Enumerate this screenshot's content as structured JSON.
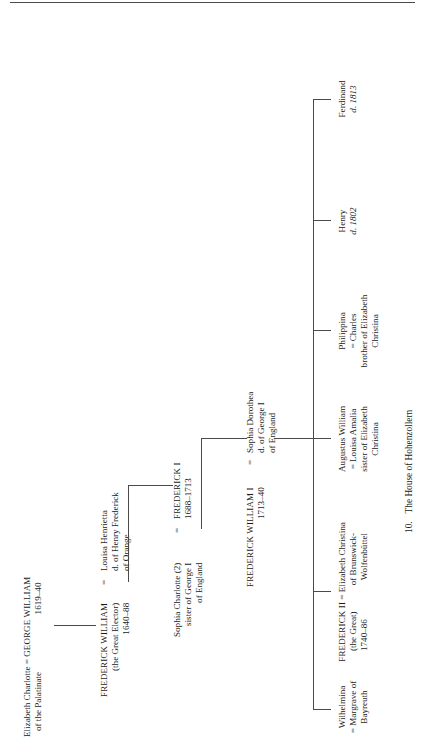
{
  "page": {
    "caption_number": "10.",
    "caption_title": "The House of Hohenzollern"
  },
  "generations": [
    {
      "id": "gen1",
      "nodes": [
        {
          "id": "n-george-william",
          "role": "couple",
          "lines": [
            "Elizabeth Charlotte = GEORGE WILLIAM",
            "of the Palatinate                    1619–40"
          ],
          "spouse_left": "Elizabeth Charlotte",
          "spouse_left_detail": "of the Palatinate",
          "principal": "GEORGE WILLIAM",
          "principal_dates": "1619–40"
        }
      ]
    },
    {
      "id": "gen2",
      "nodes": [
        {
          "id": "n-frederick-william-elector",
          "role": "couple",
          "principal": "FREDERICK WILLIAM",
          "principal_detail": "(the Great Elector)",
          "principal_dates": "1640–88",
          "equals": "=",
          "spouse_right": "Louisa Henrietta",
          "spouse_right_detail_1": "d. of Henry Frederick",
          "spouse_right_detail_2": "of Orange"
        }
      ]
    },
    {
      "id": "gen3",
      "nodes": [
        {
          "id": "n-frederick-i",
          "role": "couple",
          "spouse_left": "Sophia Charlotte (2)",
          "spouse_left_detail_1": "sister of George I",
          "spouse_left_detail_2": "of England",
          "equals": "=",
          "principal": "FREDERICK I",
          "principal_dates": "1688–1713"
        }
      ]
    },
    {
      "id": "gen4",
      "nodes": [
        {
          "id": "n-frederick-william-i",
          "role": "couple",
          "principal": "FREDERICK WILLIAM I",
          "principal_dates": "1713–40",
          "equals": "=",
          "spouse_right": "Sophia Dorothea",
          "spouse_right_detail_1": "d. of George I",
          "spouse_right_detail_2": "of England"
        }
      ]
    },
    {
      "id": "gen5",
      "nodes": [
        {
          "id": "n-wilhelmina",
          "role": "child",
          "name": "Wilhelmina",
          "detail_1": "= Margrave of",
          "detail_2": "Bayreuth"
        },
        {
          "id": "n-frederick-ii",
          "role": "child",
          "name": "FREDERICK II",
          "detail_1": "(the Great)",
          "detail_2": "1740–86",
          "equals": "=",
          "spouse": "Elizabeth Christina",
          "spouse_detail_1": "of Brunswick-",
          "spouse_detail_2": "Wolfenbüttel"
        },
        {
          "id": "n-augustus-william",
          "role": "child",
          "name": "Augustus William",
          "detail_1": "= Louisa Amalia",
          "detail_2": "sister of Elizabeth",
          "detail_3": "Christina"
        },
        {
          "id": "n-philippina",
          "role": "child",
          "name": "Philippina",
          "detail_1": "= Charles",
          "detail_2": "brother of Elizabeth",
          "detail_3": "Christina"
        },
        {
          "id": "n-henry",
          "role": "child",
          "name": "Henry",
          "detail_1": "d. 1802"
        },
        {
          "id": "n-ferdinand",
          "role": "child",
          "name": "Ferdinand",
          "detail_1": "d. 1813"
        }
      ]
    }
  ],
  "labels": {
    "george_william_spouse": "Elizabeth Charlotte",
    "george_william_spouse_detail": "of the Palatinate",
    "george_william_eq": "=",
    "george_william_name": "GEORGE WILLIAM",
    "george_william_dates": "1619–40",
    "great_elector_name": "FREDERICK WILLIAM",
    "great_elector_detail": "(the Great Elector)",
    "great_elector_dates": "1640–88",
    "great_elector_eq": "=",
    "great_elector_spouse": "Louisa Henrietta",
    "great_elector_spouse_d1": "d. of Henry Frederick",
    "great_elector_spouse_d2": "of Orange",
    "frederick_i_spouse": "Sophia Charlotte (2)",
    "frederick_i_spouse_d1": "sister of George I",
    "frederick_i_spouse_d2": "of England",
    "frederick_i_eq": "=",
    "frederick_i_name": "FREDERICK I",
    "frederick_i_dates": "1688–1713",
    "fw1_name": "FREDERICK WILLIAM I",
    "fw1_dates": "1713–40",
    "fw1_eq": "=",
    "fw1_spouse": "Sophia Dorothea",
    "fw1_spouse_d1": "d. of George I",
    "fw1_spouse_d2": "of England",
    "wilhelmina_name": "Wilhelmina",
    "wilhelmina_d1": "= Margrave of",
    "wilhelmina_d2": "Bayreuth",
    "fred2_name": "FREDERICK II",
    "fred2_d1": "(the Great)",
    "fred2_d2": "1740–86",
    "fred2_eq": "=",
    "fred2_spouse": "Elizabeth Christina",
    "fred2_spouse_d1": "of Brunswick-",
    "fred2_spouse_d2": "Wolfenbüttel",
    "augustus_name": "Augustus William",
    "augustus_d1": "= Louisa Amalia",
    "augustus_d2": "sister of Elizabeth",
    "augustus_d3": "Christina",
    "philippina_name": "Philippina",
    "philippina_d1": "= Charles",
    "philippina_d2": "brother of Elizabeth",
    "philippina_d3": "Christina",
    "henry_name": "Henry",
    "henry_d1": "d. 1802",
    "ferdinand_name": "Ferdinand",
    "ferdinand_d1": "d. 1813"
  },
  "colors": {
    "ink": "#1a1a1a",
    "rule": "#4a4a4a",
    "paper": "#ffffff"
  }
}
